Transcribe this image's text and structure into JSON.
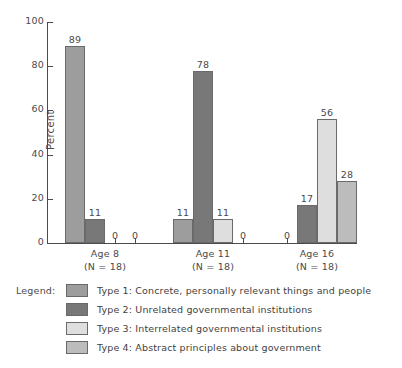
{
  "chart_data": {
    "type": "bar",
    "title": "",
    "subtitle": "",
    "xlabel": "",
    "ylabel": "Percent",
    "ylim": [
      0,
      100
    ],
    "yticks": [
      0,
      20,
      40,
      60,
      80,
      100
    ],
    "ytick_labels": [
      "0",
      "20",
      "40",
      "60",
      "80",
      "100"
    ],
    "grid": false,
    "legend_position": "below-plot",
    "legend_title": "Legend:",
    "categories": [
      "Age 8",
      "Age 11",
      "Age 16"
    ],
    "category_sublabels": [
      "(N = 18)",
      "(N = 18)",
      "(N = 18)"
    ],
    "series": [
      {
        "name": "Type 1",
        "legend_label": "Type 1:  Concrete, personally relevant things and people",
        "color": "#9d9d9d",
        "values": [
          89,
          11,
          0
        ],
        "value_labels": [
          "89",
          "11",
          "0"
        ]
      },
      {
        "name": "Type 2",
        "legend_label": "Type 2:  Unrelated governmental institutions",
        "color": "#787878",
        "values": [
          11,
          78,
          17
        ],
        "value_labels": [
          "11",
          "78",
          "17"
        ]
      },
      {
        "name": "Type 3",
        "legend_label": "Type 3:  Interrelated governmental institutions",
        "color": "#dedede",
        "values": [
          0,
          11,
          56
        ],
        "value_labels": [
          "0",
          "11",
          "56"
        ]
      },
      {
        "name": "Type 4",
        "legend_label": "Type 4:  Abstract principles about government",
        "color": "#bcbcbc",
        "values": [
          0,
          0,
          28
        ],
        "value_labels": [
          "0",
          "0",
          "28"
        ]
      }
    ]
  },
  "legend": {
    "title": "Legend:",
    "rows": [
      {
        "label": "Type 1:  Concrete, personally relevant things and people"
      },
      {
        "label": "Type 2:  Unrelated governmental institutions"
      },
      {
        "label": "Type 3:  Interrelated governmental institutions"
      },
      {
        "label": "Type 4:  Abstract principles about government"
      }
    ]
  },
  "axis": {
    "ylabel": "Percent",
    "ytick_labels": [
      "100",
      "80",
      "60",
      "40",
      "20",
      "0"
    ]
  },
  "groups": [
    {
      "name": "Age 8",
      "sublabel": "(N = 18)"
    },
    {
      "name": "Age 11",
      "sublabel": "(N = 18)"
    },
    {
      "name": "Age 16",
      "sublabel": "(N = 18)"
    }
  ]
}
